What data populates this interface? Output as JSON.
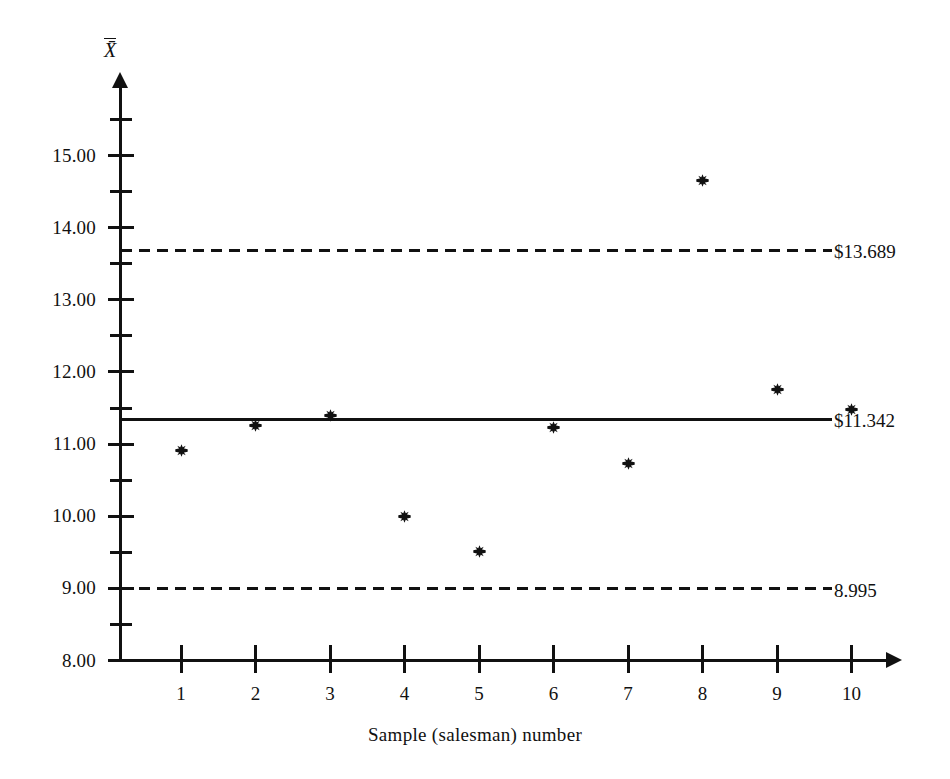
{
  "chart_data": {
    "type": "scatter",
    "title": "",
    "xlabel": "Sample  (salesman)  number",
    "ylabel": "X̄",
    "x": [
      1,
      2,
      3,
      4,
      5,
      6,
      7,
      8,
      9,
      10
    ],
    "values": [
      10.91,
      11.26,
      11.4,
      10.0,
      9.51,
      11.23,
      10.73,
      14.65,
      11.76,
      11.48
    ],
    "categories": [
      "1",
      "2",
      "3",
      "4",
      "5",
      "6",
      "7",
      "8",
      "9",
      "10"
    ],
    "xlim": [
      0,
      10.7
    ],
    "ylim": [
      8.0,
      15.35
    ],
    "grid": false,
    "legend": "none",
    "marker": "asterisk-burst",
    "y_tick_labels": [
      "15.00",
      "14.00",
      "13.00",
      "12.00",
      "11.00",
      "10.00",
      "9.00",
      "8.00"
    ],
    "y_tick_values": [
      15.0,
      14.0,
      13.0,
      12.0,
      11.0,
      10.0,
      9.0,
      8.0
    ],
    "y_minor_tick_values": [
      15.5,
      14.5,
      13.5,
      12.5,
      11.5,
      10.5,
      9.5,
      8.5
    ],
    "control_lines": [
      {
        "name": "upper-control-limit",
        "value": 13.689,
        "label": "$13.689",
        "style": "dashed"
      },
      {
        "name": "center-line",
        "value": 11.342,
        "label": "$11.342",
        "style": "solid"
      },
      {
        "name": "lower-control-limit",
        "value": 8.995,
        "label": "8.995",
        "style": "dashed"
      }
    ],
    "colors": {
      "ink": "#111111",
      "background": "#ffffff"
    }
  }
}
